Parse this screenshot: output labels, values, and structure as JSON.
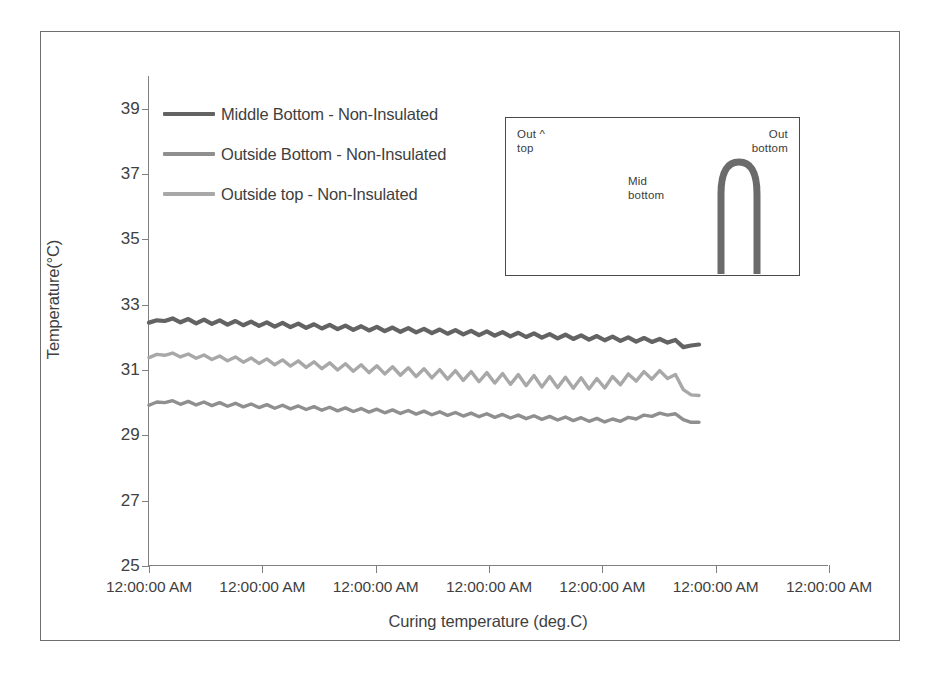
{
  "chart_data": {
    "type": "line",
    "title": "",
    "xlabel": "Curing temperature (deg.C)",
    "ylabel": "Temperature(°C)",
    "ylim": [
      25,
      40
    ],
    "yticks": [
      25,
      27,
      29,
      31,
      33,
      35,
      37,
      39
    ],
    "xticklabels": [
      "12:00:00 AM",
      "12:00:00 AM",
      "12:00:00 AM",
      "12:00:00 AM",
      "12:00:00 AM",
      "12:00:00 AM",
      "12:00:00 AM"
    ],
    "grid": false,
    "legend_position": "upper-left",
    "series": [
      {
        "name": "Middle Bottom - Non-Insulated",
        "color": "#636363",
        "values": [
          32.45,
          32.52,
          32.5,
          32.58,
          32.46,
          32.56,
          32.43,
          32.54,
          32.41,
          32.52,
          32.39,
          32.5,
          32.37,
          32.48,
          32.35,
          32.46,
          32.33,
          32.44,
          32.31,
          32.42,
          32.29,
          32.4,
          32.27,
          32.38,
          32.25,
          32.36,
          32.23,
          32.34,
          32.21,
          32.32,
          32.19,
          32.3,
          32.17,
          32.28,
          32.15,
          32.26,
          32.13,
          32.24,
          32.11,
          32.22,
          32.09,
          32.2,
          32.07,
          32.18,
          32.05,
          32.16,
          32.03,
          32.14,
          32.01,
          32.12,
          31.99,
          32.1,
          31.97,
          32.08,
          31.95,
          32.06,
          31.93,
          32.04,
          31.91,
          32.02,
          31.89,
          32.0,
          31.87,
          31.98,
          31.86,
          31.95,
          31.84,
          31.92,
          31.7,
          31.75,
          31.78
        ]
      },
      {
        "name": "Outside Bottom - Non-Insulated",
        "color": "#8f8f8f",
        "values": [
          29.92,
          30.02,
          30.0,
          30.06,
          29.95,
          30.04,
          29.93,
          30.02,
          29.91,
          30.0,
          29.89,
          29.98,
          29.87,
          29.96,
          29.85,
          29.94,
          29.83,
          29.92,
          29.81,
          29.9,
          29.79,
          29.88,
          29.77,
          29.86,
          29.75,
          29.84,
          29.73,
          29.82,
          29.71,
          29.8,
          29.69,
          29.78,
          29.67,
          29.76,
          29.65,
          29.74,
          29.63,
          29.72,
          29.61,
          29.7,
          29.59,
          29.68,
          29.57,
          29.66,
          29.55,
          29.64,
          29.53,
          29.62,
          29.51,
          29.6,
          29.49,
          29.58,
          29.47,
          29.56,
          29.45,
          29.54,
          29.43,
          29.52,
          29.41,
          29.5,
          29.43,
          29.55,
          29.5,
          29.62,
          29.58,
          29.68,
          29.62,
          29.66,
          29.48,
          29.4,
          29.4
        ]
      },
      {
        "name": "Outside top - Non-Insulated",
        "color": "#a8a8a8",
        "values": [
          31.38,
          31.48,
          31.45,
          31.52,
          31.4,
          31.49,
          31.36,
          31.46,
          31.32,
          31.43,
          31.28,
          31.4,
          31.24,
          31.37,
          31.2,
          31.34,
          31.16,
          31.31,
          31.12,
          31.28,
          31.08,
          31.25,
          31.04,
          31.22,
          31.0,
          31.19,
          30.96,
          31.16,
          30.92,
          31.13,
          30.88,
          31.1,
          30.84,
          31.07,
          30.8,
          31.04,
          30.76,
          31.01,
          30.72,
          30.98,
          30.68,
          30.95,
          30.64,
          30.92,
          30.6,
          30.89,
          30.56,
          30.86,
          30.52,
          30.83,
          30.48,
          30.8,
          30.46,
          30.78,
          30.44,
          30.76,
          30.42,
          30.74,
          30.45,
          30.8,
          30.55,
          30.88,
          30.66,
          30.95,
          30.72,
          30.98,
          30.74,
          30.86,
          30.4,
          30.24,
          30.22
        ]
      }
    ]
  },
  "legend": {
    "items": [
      {
        "label": "Middle Bottom - Non-Insulated",
        "color": "#636363"
      },
      {
        "label": "Outside Bottom - Non-Insulated",
        "color": "#8f8f8f"
      },
      {
        "label": "Outside top - Non-Insulated",
        "color": "#a8a8a8"
      }
    ]
  },
  "inset": {
    "label_out_top": "Out ^\ntop",
    "label_mid_bottom": "Mid\nbottom",
    "label_out_bottom": "Out\nbottom",
    "arch_color": "#6b6b6b"
  },
  "axis": {
    "y_title": "Temperature(°C)",
    "x_title": "Curing temperature (deg.C)",
    "yticks": [
      "39",
      "37",
      "35",
      "33",
      "31",
      "29",
      "27",
      "25"
    ],
    "xticks": [
      "12:00:00 AM",
      "12:00:00 AM",
      "12:00:00 AM",
      "12:00:00 AM",
      "12:00:00 AM",
      "12:00:00 AM",
      "12:00:00 AM"
    ]
  },
  "colors": {
    "frame": "#6f6f6f",
    "axis": "#808080",
    "text": "#3f3f3f"
  }
}
